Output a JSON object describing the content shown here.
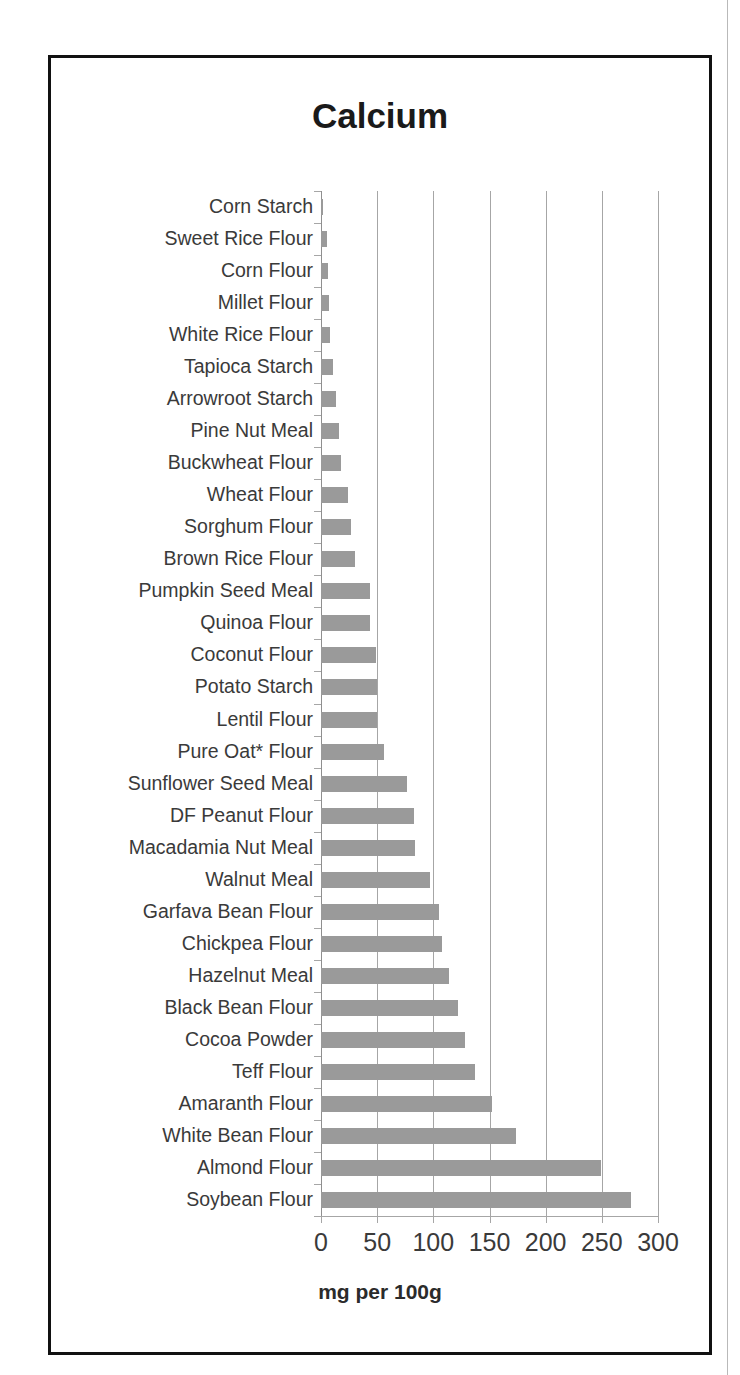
{
  "figure": {
    "frame_color": "#111111",
    "bar_color": "#9a9a9a",
    "gridline_color": "#a6a6a6",
    "text_color": "#3a3a3a"
  },
  "chart_data": {
    "type": "bar",
    "orientation": "horizontal",
    "title": "Calcium",
    "xlabel": "mg per 100g",
    "ylabel": "",
    "xlim": [
      0,
      300
    ],
    "xticks": [
      0,
      50,
      100,
      150,
      200,
      250,
      300
    ],
    "xticklabels": [
      "0",
      "50",
      "100",
      "150",
      "200",
      "250",
      "300"
    ],
    "grid": "vertical",
    "legend": "none",
    "units": "mg per 100g",
    "categories": [
      "Corn Starch",
      "Sweet Rice Flour",
      "Corn Flour",
      "Millet Flour",
      "White Rice Flour",
      "Tapioca Starch",
      "Arrowroot Starch",
      "Pine Nut Meal",
      "Buckwheat Flour",
      "Wheat Flour",
      "Sorghum Flour",
      "Brown Rice Flour",
      "Pumpkin Seed Meal",
      "Quinoa Flour",
      "Coconut Flour",
      "Potato Starch",
      "Lentil Flour",
      "Pure Oat* Flour",
      "Sunflower Seed Meal",
      "DF Peanut Flour",
      "Macadamia Nut Meal",
      "Walnut Meal",
      "Garfava Bean Flour",
      "Chickpea Flour",
      "Hazelnut Meal",
      "Black Bean Flour",
      "Cocoa Powder",
      "Teff Flour",
      "Amaranth Flour",
      "White Bean Flour",
      "Almond Flour",
      "Soybean Flour"
    ],
    "values": [
      2,
      5,
      6,
      7,
      8,
      11,
      13,
      16,
      18,
      24,
      27,
      30,
      44,
      44,
      49,
      50,
      50,
      56,
      77,
      83,
      84,
      97,
      105,
      108,
      114,
      122,
      128,
      137,
      152,
      174,
      249,
      276
    ]
  }
}
